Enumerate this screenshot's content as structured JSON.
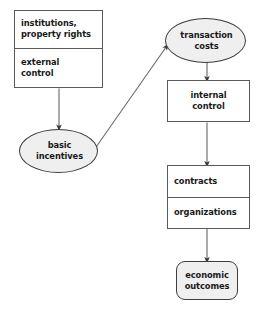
{
  "diagram": {
    "background_color": "#ffffff",
    "node_fill_gray": "#efefef",
    "node_fill_white": "#ffffff",
    "border_color": "#5a5a5a",
    "arrow_color": "#4d4d4d",
    "text_color": "#1a1a1a",
    "nodes": {
      "institutions": {
        "shape": "rect",
        "line1": "institutions,",
        "line2": "property rights"
      },
      "external_control": {
        "shape": "rect",
        "line1": "external",
        "line2": "control"
      },
      "basic_incentives": {
        "shape": "ellipse",
        "line1": "basic",
        "line2": "incentives"
      },
      "transaction_costs": {
        "shape": "ellipse",
        "line1": "transaction",
        "line2": "costs"
      },
      "internal_control": {
        "shape": "rect",
        "line1": "internal",
        "line2": "control"
      },
      "contracts": {
        "shape": "rect",
        "line1": "contracts"
      },
      "organizations": {
        "shape": "rect",
        "line1": "organizations"
      },
      "economic_outcomes": {
        "shape": "rounded-rect",
        "line1": "economic",
        "line2": "outcomes"
      }
    },
    "edges": [
      {
        "from": "external_control",
        "to": "basic_incentives",
        "style": "straight-down"
      },
      {
        "from": "basic_incentives",
        "to": "transaction_costs",
        "style": "diagonal-up-right"
      },
      {
        "from": "transaction_costs",
        "to": "internal_control",
        "style": "straight-down"
      },
      {
        "from": "internal_control",
        "to": "contracts",
        "style": "straight-down"
      },
      {
        "from": "organizations",
        "to": "economic_outcomes",
        "style": "straight-down"
      }
    ]
  }
}
